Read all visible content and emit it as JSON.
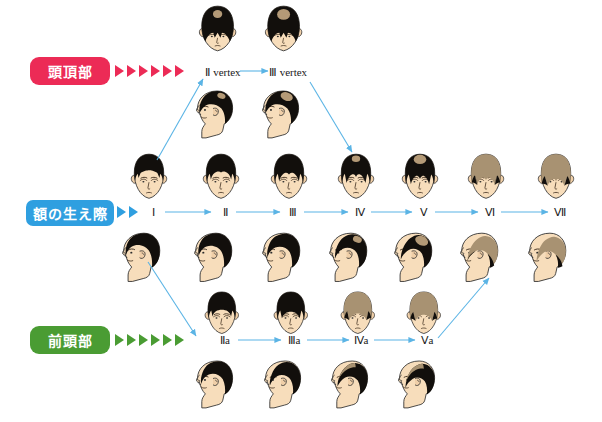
{
  "diagram": {
    "background": "#ffffff"
  },
  "colors": {
    "vertex": "#ec2b56",
    "hairline": "#2f9fe0",
    "frontal": "#4a9c33",
    "arrow": "#5bb4e5",
    "hair_dark": "#120f0c",
    "hair_thin": "#a89272",
    "skin": "#f5d9b8",
    "skin_shadow": "#e8c49c",
    "outline": "#2b2b2b"
  },
  "categories": [
    {
      "key": "vertex",
      "label": "頭頂部",
      "color": "#ec2b56",
      "chevron_count": 6
    },
    {
      "key": "hairline",
      "label": "額の生え際",
      "color": "#2f9fe0",
      "chevron_count": 2
    },
    {
      "key": "frontal",
      "label": "前頭部",
      "color": "#4a9c33",
      "chevron_count": 6
    }
  ],
  "rows": {
    "vertex_row": {
      "label_y": 74,
      "stages": [
        {
          "label": "Ⅱ vertex",
          "x": 223,
          "top_view": {
            "crown_patch": 0.22
          },
          "side_view": {
            "crown_patch": 0.2
          }
        },
        {
          "label": "Ⅲ vertex",
          "x": 288,
          "top_view": {
            "crown_patch": 0.34
          },
          "side_view": {
            "crown_patch": 0.32
          }
        }
      ]
    },
    "hairline_row": {
      "label_y": 215,
      "stages": [
        {
          "label": "Ⅰ",
          "x": 153,
          "recession": 0.05,
          "crown": 0.0,
          "thinning": 0.0
        },
        {
          "label": "Ⅱ",
          "x": 225,
          "recession": 0.22,
          "crown": 0.0,
          "thinning": 0.0
        },
        {
          "label": "Ⅲ",
          "x": 293,
          "recession": 0.38,
          "crown": 0.0,
          "thinning": 0.0
        },
        {
          "label": "Ⅳ",
          "x": 360,
          "recession": 0.5,
          "crown": 0.28,
          "thinning": 0.05
        },
        {
          "label": "Ⅴ",
          "x": 424,
          "recession": 0.6,
          "crown": 0.42,
          "thinning": 0.2
        },
        {
          "label": "Ⅵ",
          "x": 490,
          "recession": 0.72,
          "crown": 0.6,
          "thinning": 0.55
        },
        {
          "label": "Ⅶ",
          "x": 560,
          "recession": 0.85,
          "crown": 0.8,
          "thinning": 0.8
        }
      ]
    },
    "frontal_row": {
      "label_y": 343,
      "stages": [
        {
          "label": "Ⅱa",
          "x": 225,
          "recession": 0.25,
          "thinning": 0.02
        },
        {
          "label": "Ⅲa",
          "x": 294,
          "recession": 0.4,
          "thinning": 0.1
        },
        {
          "label": "Ⅳa",
          "x": 361,
          "recession": 0.55,
          "thinning": 0.4
        },
        {
          "label": "Ⅴa",
          "x": 427,
          "recession": 0.68,
          "thinning": 0.62
        }
      ]
    }
  },
  "connectors": [
    {
      "name": "vertex-2-to-3",
      "type": "horizontal",
      "from": "Ⅱ vertex",
      "to": "Ⅲ vertex"
    },
    {
      "name": "hairline-1-to-2",
      "type": "horizontal",
      "from": "Ⅰ",
      "to": "Ⅱ"
    },
    {
      "name": "hairline-2-to-3",
      "type": "horizontal",
      "from": "Ⅱ",
      "to": "Ⅲ"
    },
    {
      "name": "hairline-3-to-4",
      "type": "horizontal",
      "from": "Ⅲ",
      "to": "Ⅳ"
    },
    {
      "name": "hairline-4-to-5",
      "type": "horizontal",
      "from": "Ⅳ",
      "to": "Ⅴ"
    },
    {
      "name": "hairline-5-to-6",
      "type": "horizontal",
      "from": "Ⅴ",
      "to": "Ⅵ"
    },
    {
      "name": "hairline-6-to-7",
      "type": "horizontal",
      "from": "Ⅵ",
      "to": "Ⅶ"
    },
    {
      "name": "frontal-2a-to-3a",
      "type": "horizontal",
      "from": "Ⅱa",
      "to": "Ⅲa"
    },
    {
      "name": "frontal-3a-to-4a",
      "type": "horizontal",
      "from": "Ⅲa",
      "to": "Ⅳa"
    },
    {
      "name": "frontal-4a-to-5a",
      "type": "horizontal",
      "from": "Ⅳa",
      "to": "Ⅴa"
    },
    {
      "name": "branch-1-to-vertex2",
      "type": "diagonal",
      "from": "Ⅰ",
      "to": "Ⅱ vertex"
    },
    {
      "name": "branch-vertex3-to-4",
      "type": "diagonal",
      "from": "Ⅲ vertex",
      "to": "Ⅳ"
    },
    {
      "name": "branch-1-to-2a",
      "type": "diagonal",
      "from": "Ⅰ",
      "to": "Ⅱa"
    },
    {
      "name": "branch-5a-to-6",
      "type": "diagonal",
      "from": "Ⅴa",
      "to": "Ⅵ"
    }
  ]
}
